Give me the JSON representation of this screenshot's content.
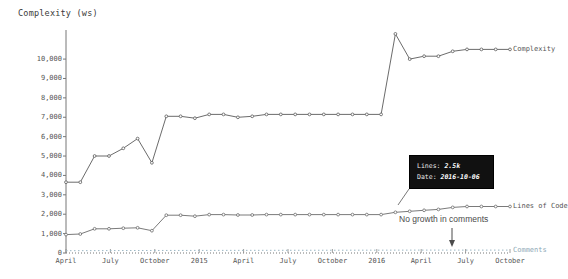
{
  "chart_data": {
    "type": "line",
    "title": "Complexity (ws)",
    "xlabel": "",
    "ylabel": "Complexity (ws)",
    "ylim": [
      0,
      11500
    ],
    "yticks": [
      0,
      1000,
      2000,
      3000,
      4000,
      5000,
      6000,
      7000,
      8000,
      9000,
      10000
    ],
    "ytick_labels": [
      "0",
      "1,000",
      "2,000",
      "3,000",
      "4,000",
      "5,000",
      "6,000",
      "7,000",
      "8,000",
      "9,000",
      "10,000"
    ],
    "xtick_labels": [
      "April",
      "July",
      "October",
      "2015",
      "April",
      "July",
      "October",
      "2016",
      "April",
      "July",
      "October"
    ],
    "grid": false,
    "legend_position": "inline-right",
    "series": [
      {
        "name": "Complexity",
        "color": "#5a5a5a",
        "label": "Complexity",
        "x": [
          0,
          1,
          2,
          3,
          4,
          5,
          6,
          7,
          8,
          9,
          10,
          11,
          12,
          13,
          14,
          15,
          16,
          17,
          18,
          19,
          20,
          21,
          22,
          23,
          24,
          25,
          26,
          27,
          28,
          29,
          30,
          31
        ],
        "values": [
          3650,
          3650,
          5000,
          5000,
          5400,
          5900,
          4650,
          7050,
          7050,
          6950,
          7150,
          7150,
          7000,
          7050,
          7150,
          7150,
          7150,
          7150,
          7150,
          7150,
          7150,
          7150,
          7150,
          11300,
          10000,
          10150,
          10150,
          10400,
          10500,
          10500,
          10500,
          10500
        ]
      },
      {
        "name": "Lines of Code",
        "color": "#6b6b6b",
        "label": "Lines of Code",
        "x": [
          0,
          1,
          2,
          3,
          4,
          5,
          6,
          7,
          8,
          9,
          10,
          11,
          12,
          13,
          14,
          15,
          16,
          17,
          18,
          19,
          20,
          21,
          22,
          23,
          24,
          25,
          26,
          27,
          28,
          29,
          30,
          31
        ],
        "values": [
          950,
          980,
          1250,
          1250,
          1280,
          1300,
          1150,
          1950,
          1950,
          1900,
          1980,
          1980,
          1960,
          1960,
          1980,
          1980,
          1980,
          1980,
          1980,
          1980,
          1980,
          1980,
          1980,
          2100,
          2150,
          2200,
          2250,
          2350,
          2400,
          2400,
          2400,
          2400
        ]
      },
      {
        "name": "Comments",
        "color": "#9bb7c4",
        "label": "Comments",
        "style": "dotted",
        "x": [
          0,
          5,
          10,
          15,
          20,
          25,
          31
        ],
        "values": [
          120,
          130,
          135,
          140,
          145,
          150,
          150
        ]
      }
    ],
    "annotations": [
      {
        "name": "no-growth-in-comments",
        "text": "No growth in comments",
        "target_series": "Comments"
      }
    ],
    "tooltip": {
      "visible": true,
      "rows": [
        {
          "key": "Lines:",
          "value": "2.5k"
        },
        {
          "key": "Date:",
          "value": "2016-10-06"
        }
      ]
    }
  }
}
